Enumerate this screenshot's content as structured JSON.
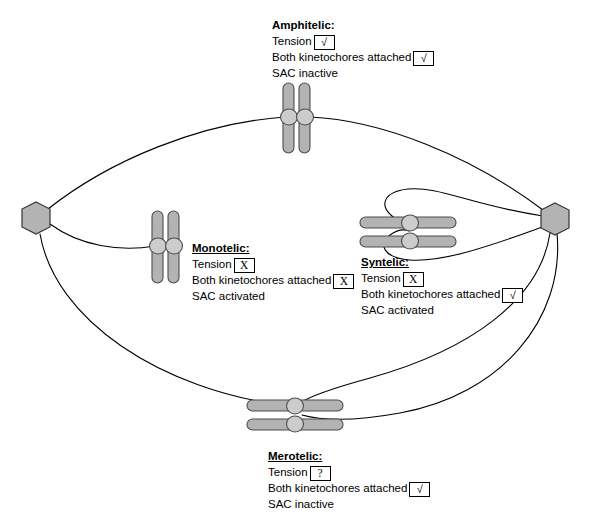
{
  "diagram": {
    "colors": {
      "chromatid_fill": "#b3b3b3",
      "chromatid_stroke": "#4d4d4d",
      "kinetochore_fill": "#cccccc",
      "kinetochore_stroke": "#4d4d4d",
      "pole_fill": "#b3b3b3",
      "pole_stroke": "#333333",
      "microtubule_stroke": "#000000",
      "text": "#000000",
      "background": "#ffffff"
    },
    "poles": [
      {
        "name": "left-spindle-pole",
        "cx": 36,
        "cy": 218,
        "r": 16
      },
      {
        "name": "right-spindle-pole",
        "cx": 555,
        "cy": 219,
        "r": 16
      }
    ],
    "labels": [
      {
        "id": "amphitelic",
        "title": "Amphitelic:",
        "underlined": false,
        "tension_label": "Tension",
        "tension_mark": "√",
        "attached_label": "Both kinetochores attached",
        "attached_mark": "√",
        "sac": "SAC inactive",
        "x": 272,
        "y": 18
      },
      {
        "id": "monotelic",
        "title": "Monotelic:",
        "underlined": true,
        "tension_label": "Tension",
        "tension_mark": "X",
        "attached_label": "Both kinetochores attached",
        "attached_mark": "X",
        "sac": "SAC activated",
        "x": 192,
        "y": 241
      },
      {
        "id": "syntelic",
        "title": "Syntelic:",
        "underlined": true,
        "tension_label": "Tension",
        "tension_mark": "X",
        "attached_label": "Both kinetochores attached",
        "attached_mark": "√",
        "sac": "SAC activated",
        "x": 361,
        "y": 255
      },
      {
        "id": "merotelic",
        "title": "Merotelic:",
        "underlined": true,
        "tension_label": "Tension",
        "tension_mark": "?",
        "attached_label": "Both kinetochores attached",
        "attached_mark": "√",
        "sac": "SAC inactive",
        "x": 268,
        "y": 449
      }
    ],
    "chromosomes": [
      {
        "id": "amphitelic-chromosome",
        "orientation": "vertical",
        "cx": 297,
        "cy": 117,
        "note": "Two sister chromatids side by side; each kinetochore attached to an opposite pole"
      },
      {
        "id": "monotelic-chromosome",
        "orientation": "vertical",
        "cx": 165,
        "cy": 245,
        "note": "Only one kinetochore attached, to the left pole"
      },
      {
        "id": "syntelic-chromosome",
        "orientation": "horizontal",
        "cx": 412,
        "cy": 225,
        "note": "Both kinetochores attached to the same (right) pole"
      },
      {
        "id": "merotelic-chromosome",
        "orientation": "horizontal",
        "cx": 297,
        "cy": 408,
        "note": "One kinetochore attached to both poles"
      }
    ],
    "microtubules": [
      {
        "id": "mt-left-to-amphitelic",
        "from": "left-spindle-pole",
        "to": "amphitelic-chromosome"
      },
      {
        "id": "mt-right-to-amphitelic",
        "from": "right-spindle-pole",
        "to": "amphitelic-chromosome"
      },
      {
        "id": "mt-left-to-monotelic",
        "from": "left-spindle-pole",
        "to": "monotelic-chromosome"
      },
      {
        "id": "mt-right-to-syntelic-upper",
        "from": "right-spindle-pole",
        "to": "syntelic-chromosome"
      },
      {
        "id": "mt-right-to-syntelic-lower",
        "from": "right-spindle-pole",
        "to": "syntelic-chromosome"
      },
      {
        "id": "mt-left-to-merotelic",
        "from": "left-spindle-pole",
        "to": "merotelic-chromosome"
      },
      {
        "id": "mt-right-to-merotelic-upper",
        "from": "right-spindle-pole",
        "to": "merotelic-chromosome"
      },
      {
        "id": "mt-right-to-merotelic-lower",
        "from": "right-spindle-pole",
        "to": "merotelic-chromosome"
      }
    ]
  }
}
